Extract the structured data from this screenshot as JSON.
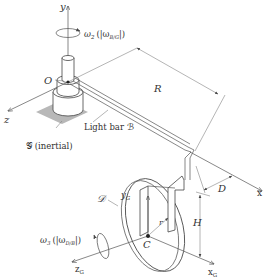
{
  "figure": {
    "type": "mechanical-diagram"
  },
  "labels": {
    "y_axis": "y",
    "z_axis": "z",
    "x_axis": "x",
    "origin": "O",
    "omega2_sym": "ω",
    "omega2_sub": "2",
    "omega2_paren": "(|ω",
    "omega2_rel": "B/G",
    "omega2_close": "|)",
    "ground": "𝒢 (inertial)",
    "bar": "Light bar ℬ",
    "R": "R",
    "D": "D",
    "H": "H",
    "disk": "𝒟",
    "yG": "y",
    "yG_sub": "G",
    "r": "r",
    "C": "C",
    "omega3_sym": "ω",
    "omega3_sub": "3",
    "omega3_paren": "(|ω",
    "omega3_rel": "D/B",
    "omega3_close": "|)",
    "zG": "z",
    "zG_sub": "G",
    "xG": "x",
    "xG_sub": "G"
  },
  "colors": {
    "line": "#555555",
    "ground_patch": "#b8b8b8",
    "text": "#333333"
  }
}
